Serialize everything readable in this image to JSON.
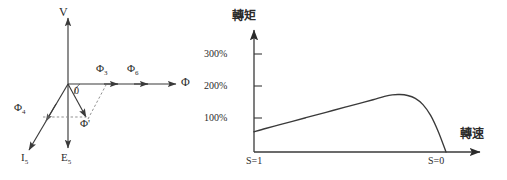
{
  "figure": {
    "panels": [
      {
        "id": "phasor-diagram",
        "kind": "vector-phasor-diagram",
        "axes": {
          "vertical_label": "V",
          "horizontal_label": "Φ"
        },
        "angle_label": "θ",
        "vectors": [
          {
            "name": "phi-3",
            "label_base": "Φ",
            "label_sub": "3"
          },
          {
            "name": "phi-6",
            "label_base": "Φ",
            "label_sub": "6"
          },
          {
            "name": "phi-4",
            "label_base": "Φ",
            "label_sub": "4"
          },
          {
            "name": "phi-prime",
            "label_base": "Φ",
            "label_sub": "'"
          },
          {
            "name": "current-i5",
            "label_base": "I",
            "label_sub": "5"
          },
          {
            "name": "emf-e5",
            "label_base": "E",
            "label_sub": "5"
          }
        ],
        "origin_label": "0"
      },
      {
        "id": "torque-speed-curve",
        "kind": "line-chart"
      }
    ]
  },
  "chart_data": {
    "type": "line",
    "title": "",
    "ylabel": "轉矩",
    "xlabel": "轉速",
    "grid": false,
    "legend": null,
    "ytick_labels": [
      "100%",
      "200%",
      "300%"
    ],
    "ytick_values": [
      100,
      200,
      300
    ],
    "ylim": [
      0,
      350
    ],
    "xtick_labels": [
      "S=1",
      "S=0"
    ],
    "xlim": [
      0,
      1
    ],
    "x_axis_direction": "slip 1 at left to slip 0 at right",
    "series": [
      {
        "name": "torque",
        "x": [
          0.0,
          0.06,
          0.13,
          0.2,
          0.27,
          0.34,
          0.41,
          0.48,
          0.55,
          0.62,
          0.68,
          0.72,
          0.76,
          0.8,
          0.84,
          0.88,
          0.92,
          0.96,
          1.0
        ],
        "values": [
          62,
          72,
          83,
          94,
          105,
          116,
          127,
          138,
          149,
          160,
          170,
          175,
          176,
          173,
          164,
          145,
          112,
          62,
          0
        ]
      }
    ],
    "annotations": [
      {
        "name": "peak-torque",
        "x": 0.75,
        "y": 176,
        "text": ""
      },
      {
        "name": "start-torque",
        "x": 0.0,
        "y": 62,
        "text": ""
      }
    ]
  }
}
